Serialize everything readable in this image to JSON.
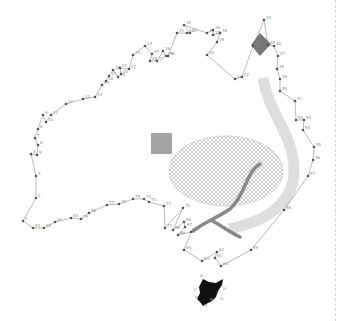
{
  "puzzle": {
    "subject": "Australia connect-the-dots",
    "line_color": "#777777",
    "dot_color": "#555555",
    "label_color": "#8a8a8a"
  },
  "dots": [
    {
      "n": "1",
      "x": 23,
      "y": 221
    },
    {
      "n": "2",
      "x": 36,
      "y": 198
    },
    {
      "n": "3",
      "x": 36,
      "y": 176
    },
    {
      "n": "4",
      "x": 31,
      "y": 154
    },
    {
      "n": "5",
      "x": 37,
      "y": 155
    },
    {
      "n": "6",
      "x": 38,
      "y": 145
    },
    {
      "n": "7",
      "x": 35,
      "y": 138
    },
    {
      "n": "8",
      "x": 38,
      "y": 129
    },
    {
      "n": "9",
      "x": 43,
      "y": 115
    },
    {
      "n": "10",
      "x": 46,
      "y": 122
    },
    {
      "n": "11",
      "x": 51,
      "y": 115
    },
    {
      "n": "12",
      "x": 66,
      "y": 104
    },
    {
      "n": "13",
      "x": 83,
      "y": 99
    },
    {
      "n": "14",
      "x": 95,
      "y": 97
    },
    {
      "n": "15",
      "x": 102,
      "y": 85
    },
    {
      "n": "16",
      "x": 106,
      "y": 81
    },
    {
      "n": "17",
      "x": 109,
      "y": 76
    },
    {
      "n": "18",
      "x": 113,
      "y": 70
    },
    {
      "n": "19",
      "x": 118,
      "y": 77
    },
    {
      "n": "20",
      "x": 121,
      "y": 74
    },
    {
      "n": "21",
      "x": 120,
      "y": 68
    },
    {
      "n": "22",
      "x": 129,
      "y": 69
    },
    {
      "n": "23",
      "x": 133,
      "y": 55
    },
    {
      "n": "24",
      "x": 145,
      "y": 46
    },
    {
      "n": "25",
      "x": 152,
      "y": 54
    },
    {
      "n": "26",
      "x": 150,
      "y": 61
    },
    {
      "n": "27",
      "x": 157,
      "y": 61
    },
    {
      "n": "28",
      "x": 163,
      "y": 51
    },
    {
      "n": "29",
      "x": 166,
      "y": 56
    },
    {
      "n": "30",
      "x": 168,
      "y": 56
    },
    {
      "n": "31",
      "x": 177,
      "y": 33
    },
    {
      "n": "32",
      "x": 187,
      "y": 33
    },
    {
      "n": "33",
      "x": 190,
      "y": 33
    },
    {
      "n": "34",
      "x": 184,
      "y": 25
    },
    {
      "n": "35",
      "x": 207,
      "y": 33
    },
    {
      "n": "36",
      "x": 213,
      "y": 30
    },
    {
      "n": "37",
      "x": 213,
      "y": 35
    },
    {
      "n": "38",
      "x": 220,
      "y": 33
    },
    {
      "n": "39",
      "x": 217,
      "y": 42
    },
    {
      "n": "40",
      "x": 207,
      "y": 55
    },
    {
      "n": "41",
      "x": 235,
      "y": 79
    },
    {
      "n": "42",
      "x": 242,
      "y": 77
    },
    {
      "n": "43",
      "x": 253,
      "y": 46
    },
    {
      "n": "44",
      "x": 264,
      "y": 20
    },
    {
      "n": "45",
      "x": 268,
      "y": 45
    },
    {
      "n": "46",
      "x": 274,
      "y": 46
    },
    {
      "n": "47",
      "x": 278,
      "y": 56
    },
    {
      "n": "48",
      "x": 277,
      "y": 69
    },
    {
      "n": "49",
      "x": 280,
      "y": 79
    },
    {
      "n": "50",
      "x": 280,
      "y": 91
    },
    {
      "n": "51",
      "x": 295,
      "y": 101
    },
    {
      "n": "52",
      "x": 296,
      "y": 120
    },
    {
      "n": "53",
      "x": 304,
      "y": 120
    },
    {
      "n": "54",
      "x": 303,
      "y": 130
    },
    {
      "n": "55",
      "x": 314,
      "y": 147
    },
    {
      "n": "56",
      "x": 313,
      "y": 160
    },
    {
      "n": "57",
      "x": 308,
      "y": 176
    },
    {
      "n": "58",
      "x": 284,
      "y": 210
    },
    {
      "n": "59",
      "x": 251,
      "y": 250
    },
    {
      "n": "60",
      "x": 221,
      "y": 266
    },
    {
      "n": "61",
      "x": 215,
      "y": 258
    },
    {
      "n": "62",
      "x": 217,
      "y": 252
    },
    {
      "n": "63",
      "x": 202,
      "y": 261
    },
    {
      "n": "64",
      "x": 184,
      "y": 250
    },
    {
      "n": "65",
      "x": 191,
      "y": 232
    },
    {
      "n": "66",
      "x": 178,
      "y": 235
    },
    {
      "n": "67",
      "x": 185,
      "y": 227
    },
    {
      "n": "68",
      "x": 184,
      "y": 222
    },
    {
      "n": "69",
      "x": 173,
      "y": 230
    },
    {
      "n": "70",
      "x": 183,
      "y": 208
    },
    {
      "n": "71",
      "x": 165,
      "y": 228
    },
    {
      "n": "72",
      "x": 164,
      "y": 206
    },
    {
      "n": "73",
      "x": 149,
      "y": 202
    },
    {
      "n": "74",
      "x": 144,
      "y": 199
    },
    {
      "n": "75",
      "x": 133,
      "y": 199
    },
    {
      "n": "76",
      "x": 119,
      "y": 204
    },
    {
      "n": "77",
      "x": 107,
      "y": 205
    },
    {
      "n": "78",
      "x": 89,
      "y": 213
    },
    {
      "n": "79",
      "x": 81,
      "y": 219
    },
    {
      "n": "80",
      "x": 71,
      "y": 218
    },
    {
      "n": "81",
      "x": 55,
      "y": 222
    },
    {
      "n": "82",
      "x": 44,
      "y": 228
    },
    {
      "n": "83",
      "x": 33,
      "y": 228
    }
  ],
  "tasmania_labels": [
    "A",
    "B",
    "C",
    "D",
    "E",
    "F",
    "G",
    "H"
  ],
  "shapes": {
    "square": {
      "color": "#a3a3a3"
    },
    "ellipse": {
      "fill": "#f2f2f2",
      "hatch": "#9a9a9a"
    },
    "band": {
      "color": "#dedede"
    },
    "river": {
      "color": "#888888"
    },
    "diamond": {
      "color": "#777777"
    },
    "island": {
      "color": "#111111"
    }
  }
}
